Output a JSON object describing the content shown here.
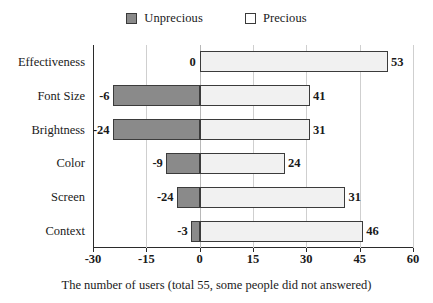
{
  "chart_data": {
    "type": "bar",
    "orientation": "horizontal",
    "stacked": "diverging",
    "title": "",
    "xlabel": "The number of users (total 55, some people did not answered)",
    "ylabel": "",
    "xlim": [
      -30,
      60
    ],
    "xticks": [
      -30,
      -15,
      0,
      15,
      30,
      45,
      60
    ],
    "xtick_labels": [
      "-30",
      "-15",
      "0",
      "15",
      "30",
      "45",
      "60"
    ],
    "grid": true,
    "grid_axis": "x",
    "legend_position": "top-center",
    "categories": [
      "Effectiveness",
      "Font Size",
      "Brightness",
      "Color",
      "Screen",
      "Context"
    ],
    "series": [
      {
        "name": "Unprecious",
        "color": "#8a8a8a",
        "values": [
          0,
          -6,
          -24,
          -9,
          -24,
          -3
        ],
        "labels": [
          "0",
          "-6",
          "-24",
          "-9",
          "-24",
          "-3"
        ],
        "drawn_extent": [
          0,
          -24.5,
          -24.5,
          -9.5,
          -6.5,
          -2.5
        ]
      },
      {
        "name": "Precious",
        "color": "#f1f1f1",
        "values": [
          53,
          41,
          31,
          24,
          31,
          46
        ],
        "labels": [
          "53",
          "41",
          "31",
          "24",
          "31",
          "46"
        ],
        "drawn_extent": [
          53,
          31,
          31,
          24,
          41,
          46
        ]
      }
    ]
  },
  "legend": {
    "entries": [
      {
        "label": "Unprecious",
        "color": "#8a8a8a"
      },
      {
        "label": "Precious",
        "color": "#f1f1f1"
      }
    ]
  },
  "axis": {
    "caption": "The number of users (total 55, some people did not answered)"
  }
}
